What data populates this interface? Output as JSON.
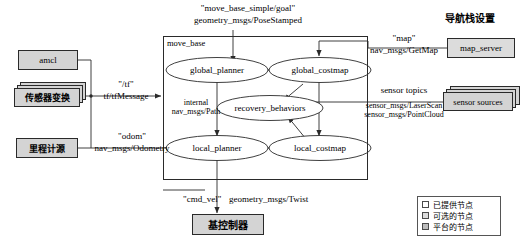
{
  "diagram": {
    "title": "导航栈设置",
    "goal_topic": "\"move_base_simple/goal\"",
    "goal_type": "geometry_msgs/PoseStamped",
    "container_label": "move_base",
    "colors": {
      "node_gray": "#d4d4d4",
      "outline": "#2a2a2a",
      "background": "#ffffff"
    }
  },
  "external_nodes": {
    "amcl": "amcl",
    "tf_transform": "传感器变换",
    "odometry_source": "里程计源",
    "map_server": "map_server",
    "sensor_sources": "sensor sources",
    "base_controller": "基控制器"
  },
  "internal_nodes": {
    "global_planner": "global_planner",
    "global_costmap": "global_costmap",
    "recovery_behaviors": "recovery_behaviors",
    "local_planner": "local_planner",
    "local_costmap": "local_costmap"
  },
  "edge_labels": {
    "tf_topic": "\"/tf\"",
    "tf_type": "tf/tfMessage",
    "odom_topic": "\"odom\"",
    "odom_type": "nav_msgs/Odometry",
    "internal_line1": "internal",
    "internal_line2": "nav_msgs/Path",
    "map_topic": "\"map\"",
    "map_type": "nav_msgs/GetMap",
    "sensor_topics": "sensor topics",
    "sensor_type1": "sensor_msgs/LaserScan",
    "sensor_type2": "sensor_msgs/PointCloud",
    "cmd_vel_topic": "\"cmd_vel\"",
    "cmd_vel_type": "geometry_msgs/Twist"
  },
  "legend": {
    "items": [
      {
        "label": "已提供节点",
        "color": "#ffffff"
      },
      {
        "label": "可选的节点",
        "color": "#dcdcdc"
      },
      {
        "label": "平台的节点",
        "color": "#bcbcbc"
      }
    ]
  }
}
